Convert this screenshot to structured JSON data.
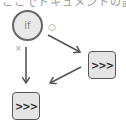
{
  "header": {
    "cut_off_text": "ここでドキュメントの記述"
  },
  "diagram": {
    "condition_node": {
      "label": "if"
    },
    "branch_true_label": "○",
    "branch_false_label": "×",
    "process_node_right": {
      "label": ">>>"
    },
    "process_node_bottom": {
      "label": ">>>"
    }
  },
  "colors": {
    "stroke": "#555555",
    "node_fill": "#e6e6e6",
    "label": "#999999"
  }
}
